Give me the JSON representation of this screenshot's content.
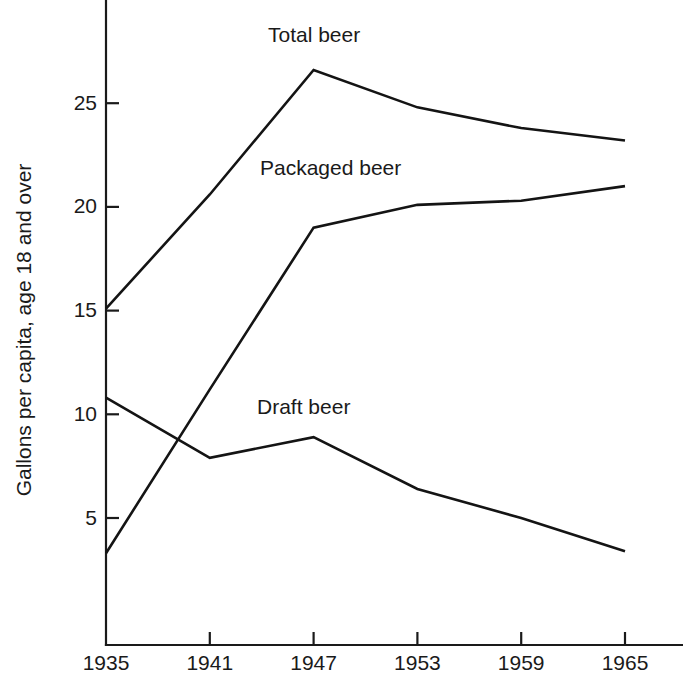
{
  "chart_data": {
    "type": "line",
    "title": "",
    "xlabel": "",
    "ylabel": "Gallons per capita, age 18 and over",
    "x": [
      1935,
      1941,
      1947,
      1953,
      1959,
      1965
    ],
    "xtick_labels": [
      "1935",
      "1941",
      "1947",
      "1953",
      "1959",
      "1965"
    ],
    "ytick_values": [
      5,
      10,
      15,
      20,
      25
    ],
    "ytick_labels": [
      "5",
      "10",
      "15",
      "20",
      "25"
    ],
    "xlim": [
      1935,
      1965
    ],
    "ylim": [
      0,
      28
    ],
    "grid": false,
    "legend_position": "inline-annotations",
    "series": [
      {
        "name": "Total beer",
        "label": "Total beer",
        "values": [
          15.1,
          20.6,
          26.6,
          24.8,
          23.8,
          23.2
        ],
        "color": "#141414",
        "annotation": {
          "text": "Total beer",
          "x_px": 268,
          "y_px": 42
        }
      },
      {
        "name": "Packaged beer",
        "label": "Packaged beer",
        "values": [
          3.3,
          11.2,
          19.0,
          20.1,
          20.3,
          21.0
        ],
        "color": "#141414",
        "annotation": {
          "text": "Packaged beer",
          "x_px": 260,
          "y_px": 175
        }
      },
      {
        "name": "Draft beer",
        "label": "Draft beer",
        "values": [
          10.8,
          7.9,
          8.9,
          6.4,
          5.0,
          3.4
        ],
        "color": "#141414",
        "annotation": {
          "text": "Draft beer",
          "x_px": 257,
          "y_px": 414
        }
      }
    ]
  },
  "axes": {
    "y_axis_title": "Gallons per capita, age 18 and over",
    "y_tick_labels": [
      "25",
      "20",
      "15",
      "10",
      "5"
    ],
    "x_tick_labels": [
      "1935",
      "1941",
      "1947",
      "1953",
      "1959",
      "1965"
    ]
  },
  "annotations": {
    "total_beer": "Total beer",
    "packaged_beer": "Packaged beer",
    "draft_beer": "Draft beer"
  }
}
